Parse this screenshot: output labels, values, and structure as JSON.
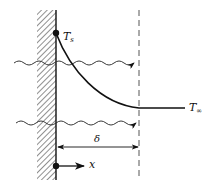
{
  "diagram": {
    "type": "thermal boundary layer",
    "labels": {
      "surface_temp": "T",
      "surface_temp_sub": "s",
      "free_stream_temp": "T",
      "free_stream_temp_sub": "∞",
      "thickness": "δ",
      "x_axis": "x"
    },
    "colors": {
      "line": "#111111",
      "hatch": "#444444",
      "dashed": "#555555"
    }
  }
}
